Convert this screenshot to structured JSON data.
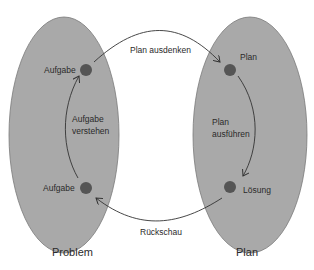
{
  "colors": {
    "ellipse_fill": "#a9a9a9",
    "ellipse_stroke": "#7a7a7a",
    "node_fill": "#555555",
    "arrow": "#333333",
    "text": "#2a2a2a"
  },
  "left_group": {
    "caption": "Problem",
    "top_node_label": "Aufgabe",
    "bottom_node_label": "Aufgabe",
    "arrow_label_line1": "Aufgabe",
    "arrow_label_line2": "verstehen"
  },
  "right_group": {
    "caption": "Plan",
    "top_node_label": "Plan",
    "bottom_node_label": "Lösung",
    "arrow_label_line1": "Plan",
    "arrow_label_line2": "ausführen"
  },
  "top_arrow_label": "Plan ausdenken",
  "bottom_arrow_label": "Rückschau"
}
